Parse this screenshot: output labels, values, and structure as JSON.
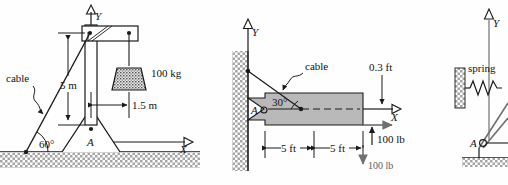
{
  "figure": {
    "type": "engineering-statics-diagrams",
    "panel_count": 3
  },
  "panel_left": {
    "name": "mast-with-cable-and-hanging-mass",
    "labels": {
      "cable": "cable",
      "mass": "100 kg",
      "height_dim": "5 m",
      "offset_dim": "1.5 m",
      "angle": "60°",
      "support_point": "A",
      "axis_x": "X",
      "axis_y": "Y"
    },
    "values": {
      "mass_kg": 100,
      "height_m": 5,
      "offset_m": 1.5,
      "cable_angle_deg": 60
    }
  },
  "panel_middle": {
    "name": "cantilever-beam-with-cable-and-forces",
    "labels": {
      "cable": "cable",
      "angle": "30°",
      "support_point": "A",
      "thickness_dim": "0.3 ft",
      "dim_left": "5 ft",
      "dim_right": "5 ft",
      "force_up": "100 lb",
      "force_down": "100 lb",
      "axis_x": "X",
      "axis_y": "Y"
    },
    "values": {
      "cable_angle_deg": 30,
      "offset_ft": 0.3,
      "span_segment_ft": 5,
      "force_lb": 100
    }
  },
  "panel_right": {
    "name": "spring-supported-linkage",
    "labels": {
      "spring": "spring",
      "support_point": "A",
      "axis_y": "Y"
    }
  },
  "colors": {
    "stroke": "#1a1a1a",
    "beam_fill": "#b9b9b9",
    "hatch_gray": "#9a9a9a",
    "force_gray": "#6f6f6f",
    "background": "#fefefe"
  }
}
